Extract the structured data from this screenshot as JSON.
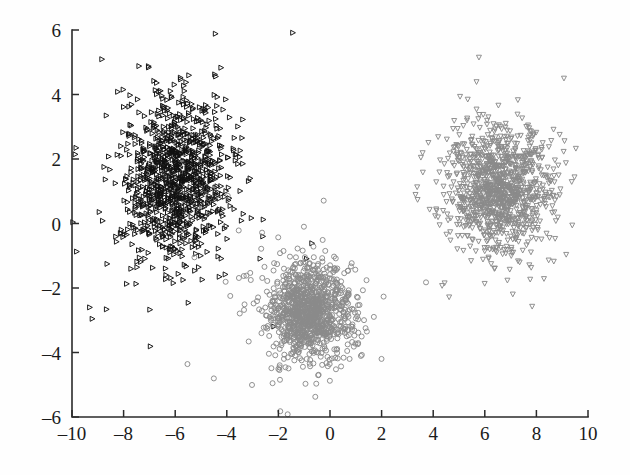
{
  "chart_data": {
    "type": "scatter",
    "title": "",
    "subtitle": "",
    "xlabel": "",
    "ylabel": "",
    "xlim": [
      -10,
      10
    ],
    "ylim": [
      -6,
      6
    ],
    "xticks": [
      -10,
      -8,
      -6,
      -4,
      -2,
      0,
      2,
      4,
      6,
      8,
      10
    ],
    "yticks": [
      -6,
      -4,
      -2,
      0,
      2,
      4,
      6
    ],
    "xtick_labels": [
      "-10",
      "-8",
      "-6",
      "-4",
      "-2",
      "0",
      "2",
      "4",
      "6",
      "8",
      "10"
    ],
    "ytick_labels": [
      "-6",
      "-4",
      "-2",
      "0",
      "2",
      "4",
      "6"
    ],
    "grid": false,
    "legend": "none",
    "frame": "left-bottom-spines-only",
    "tick_direction": "in",
    "series": [
      {
        "name": "cluster-1",
        "marker": "triangle-right",
        "color": "#111111",
        "filled": false,
        "marker_size": 5,
        "count": 1000,
        "center": [
          -6.0,
          1.4
        ],
        "spread": [
          1.05,
          1.25
        ],
        "outlier_count": 70,
        "outlier_spread": [
          2.1,
          2.3
        ],
        "seed": 17
      },
      {
        "name": "cluster-2",
        "marker": "circle",
        "color": "#8a8a8a",
        "filled": false,
        "marker_size": 5,
        "count": 1000,
        "center": [
          -0.8,
          -2.75
        ],
        "spread": [
          0.78,
          0.72
        ],
        "outlier_count": 85,
        "outlier_spread": [
          1.75,
          1.45
        ],
        "seed": 43
      },
      {
        "name": "cluster-3",
        "marker": "triangle-down",
        "color": "#8a8a8a",
        "filled": false,
        "marker_size": 5,
        "count": 1000,
        "center": [
          6.6,
          1.05
        ],
        "spread": [
          0.95,
          0.95
        ],
        "outlier_count": 95,
        "outlier_spread": [
          1.85,
          1.55
        ],
        "seed": 91
      }
    ],
    "colors": {
      "axis": "#2b2b2b",
      "tick_text": "#1a1a1a",
      "background": "#ffffff",
      "cluster_1": "#111111",
      "cluster_2": "#8a8a8a",
      "cluster_3": "#8a8a8a"
    },
    "geometry": {
      "plot_left": 72,
      "plot_right": 588,
      "plot_top": 30,
      "plot_bottom": 417
    }
  }
}
